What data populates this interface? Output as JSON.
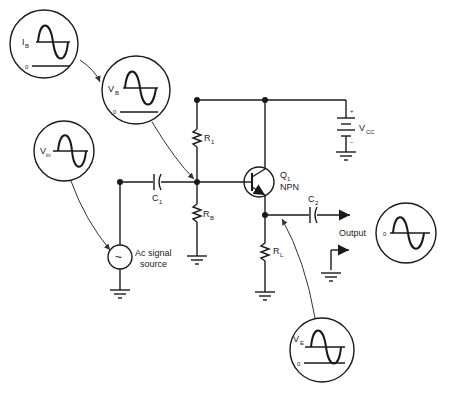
{
  "diagram": {
    "title": "",
    "components": {
      "r1": {
        "label": "R",
        "sub": "1"
      },
      "rb": {
        "label": "R",
        "sub": "B"
      },
      "rl": {
        "label": "R",
        "sub": "L"
      },
      "c1": {
        "label": "C",
        "sub": "1"
      },
      "c2": {
        "label": "C",
        "sub": "2"
      },
      "q1": {
        "label": "Q",
        "sub": "1",
        "type": "NPN"
      },
      "vcc": {
        "label": "V",
        "sub": "CC",
        "plus": "+",
        "minus": "−"
      },
      "source": {
        "line1": "Ac signal",
        "line2": "source",
        "symbol": "~"
      },
      "output": {
        "label": "Output"
      }
    },
    "waveforms": {
      "ib": {
        "label": "I",
        "sub": "B",
        "zero": "0"
      },
      "vb": {
        "label": "V",
        "sub": "B",
        "zero": "0"
      },
      "vin": {
        "label": "V",
        "sub": "in"
      },
      "ve": {
        "label": "V",
        "sub": "E",
        "zero": "0"
      },
      "vout": {
        "zero": "0"
      }
    }
  }
}
